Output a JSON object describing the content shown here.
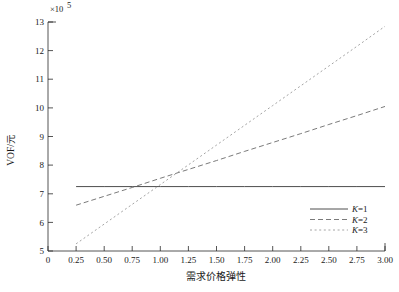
{
  "chart_data": {
    "type": "line",
    "title": "",
    "xlabel": "需求价格弹性",
    "ylabel": "VOF/元",
    "y_multiplier": "×10",
    "y_exponent": "5",
    "xlim": [
      0,
      3.0
    ],
    "ylim": [
      5,
      13
    ],
    "grid": false,
    "legend_position": "bottom-right",
    "x_ticks": [
      "0",
      "0.25",
      "0.50",
      "0.75",
      "1.00",
      "1.25",
      "1.50",
      "1.75",
      "2.00",
      "2.25",
      "2.50",
      "2.75",
      "3.00"
    ],
    "x_tick_values": [
      0,
      0.25,
      0.5,
      0.75,
      1.0,
      1.25,
      1.5,
      1.75,
      2.0,
      2.25,
      2.5,
      2.75,
      3.0
    ],
    "y_ticks": [
      "5",
      "6",
      "7",
      "8",
      "9",
      "10",
      "11",
      "12",
      "13"
    ],
    "y_tick_values": [
      5,
      6,
      7,
      8,
      9,
      10,
      11,
      12,
      13
    ],
    "x": [
      0.25,
      0.5,
      0.75,
      1.0,
      1.25,
      1.5,
      1.75,
      2.0,
      2.25,
      2.5,
      2.75,
      3.0
    ],
    "series": [
      {
        "name": "K=1",
        "style": "solid",
        "color": "#3a3a3a",
        "values": [
          7.25,
          7.25,
          7.25,
          7.25,
          7.25,
          7.25,
          7.25,
          7.25,
          7.25,
          7.25,
          7.25,
          7.25
        ]
      },
      {
        "name": "K=2",
        "style": "dashed",
        "color": "#6b6b6b",
        "values": [
          6.6,
          6.91,
          7.22,
          7.54,
          7.85,
          8.16,
          8.48,
          8.79,
          9.1,
          9.42,
          9.73,
          10.05
        ]
      },
      {
        "name": "K=3",
        "style": "dotted",
        "color": "#9a9a9a",
        "values": [
          5.25,
          5.94,
          6.63,
          7.32,
          8.01,
          8.7,
          9.39,
          10.08,
          10.77,
          11.46,
          12.15,
          12.85
        ]
      }
    ]
  },
  "legend": {
    "entries": [
      {
        "label": "K=1",
        "symbol": "K",
        "rest": "=1"
      },
      {
        "label": "K=2",
        "symbol": "K",
        "rest": "=2"
      },
      {
        "label": "K=3",
        "symbol": "K",
        "rest": "=3"
      }
    ]
  }
}
